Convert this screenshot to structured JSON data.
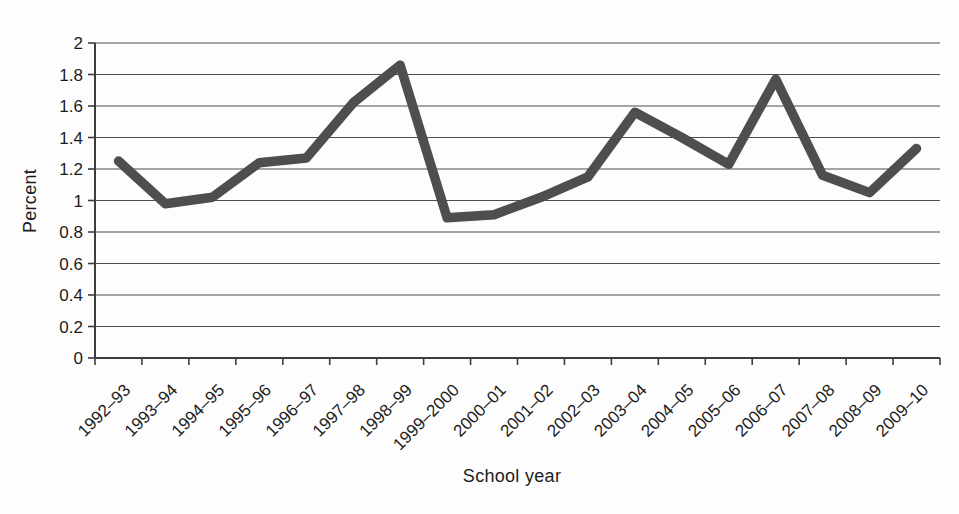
{
  "chart_data": {
    "type": "line",
    "title": "",
    "xlabel": "School year",
    "ylabel": "Percent",
    "categories": [
      "1992–93",
      "1993–94",
      "1994–95",
      "1995–96",
      "1996–97",
      "1997–98",
      "1998–99",
      "1999–2000",
      "2000–01",
      "2001–02",
      "2002–03",
      "2003–04",
      "2004–05",
      "2005–06",
      "2006–07",
      "2007–08",
      "2008–09",
      "2009–10"
    ],
    "series": [
      {
        "name": "Percent",
        "values": [
          1.25,
          0.98,
          1.02,
          1.24,
          1.27,
          1.62,
          1.86,
          0.89,
          0.91,
          1.02,
          1.15,
          1.56,
          1.4,
          1.23,
          1.77,
          1.16,
          1.05,
          1.33
        ]
      }
    ],
    "ylim": [
      0,
      2
    ],
    "ytick_step": 0.2,
    "ytick_labels": [
      "0",
      "0.2",
      "0.4",
      "0.6",
      "0.8",
      "1",
      "1.2",
      "1.4",
      "1.6",
      "1.8",
      "2"
    ],
    "grid": "horizontal-on",
    "legend": "none",
    "x_label_rotation_deg": -45,
    "colors": {
      "line": "#4e4e4e",
      "grid": "#4d4d4d",
      "axis": "#3d3d3d",
      "text": "#1c1c1c",
      "background": "#fdfdfd"
    }
  }
}
